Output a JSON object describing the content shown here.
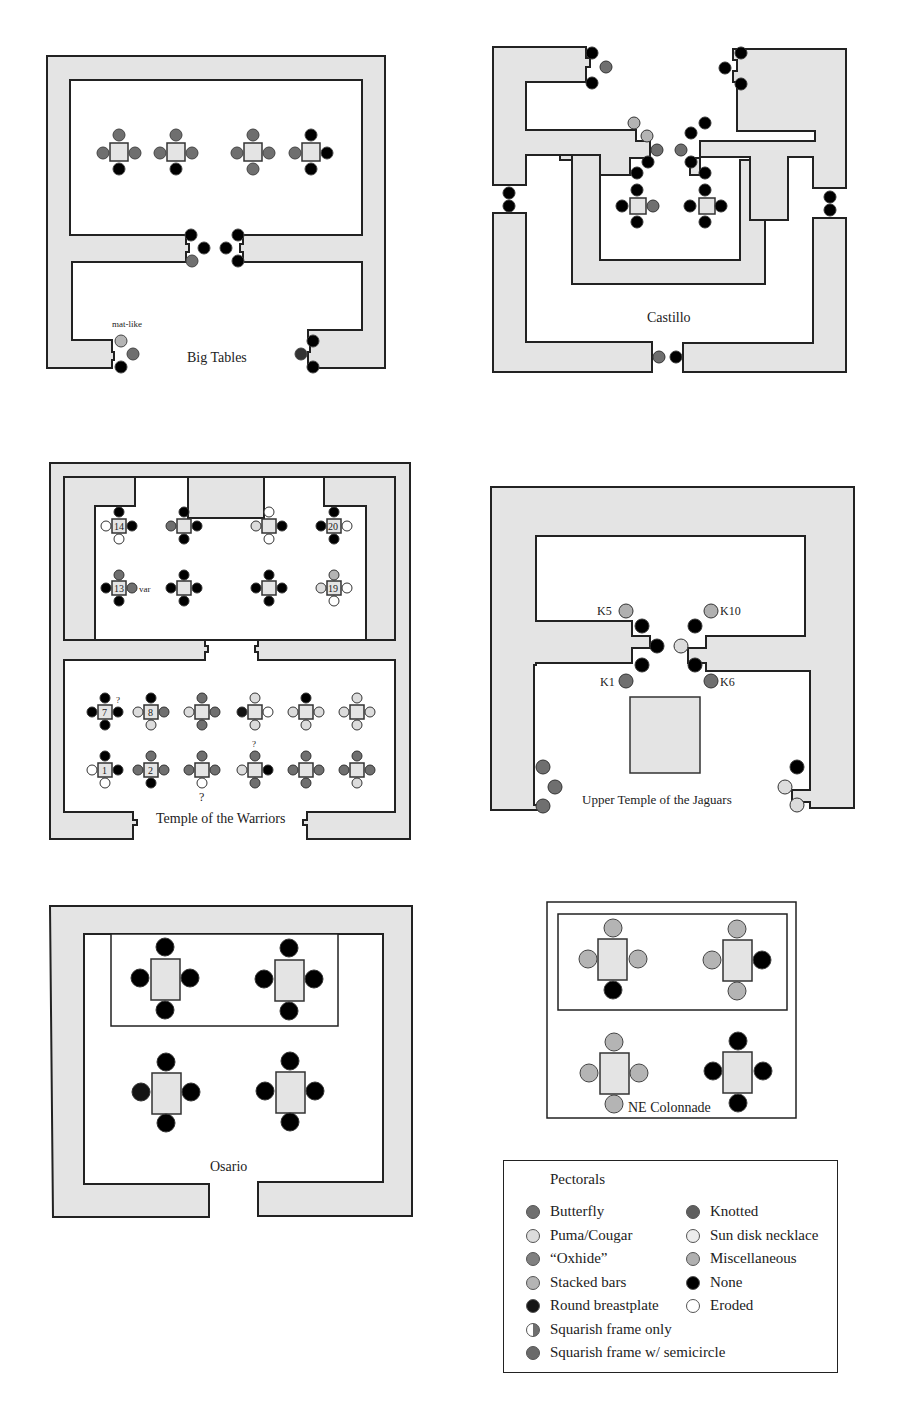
{
  "colors": {
    "wall": "#e4e4e4",
    "butterfly": "#6f6f6f",
    "puma_cougar": "#dcdcdc",
    "oxhide": "#808080",
    "stacked_bars": "#b4b4b4",
    "round_breastplate": "#141414",
    "knotted": "#5f5f5f",
    "sun_disk_necklace": "#ececec",
    "miscellaneous": "#b0b0b0",
    "none": "#000000",
    "eroded": "#ffffff"
  },
  "panels": {
    "big_tables": {
      "title": "Big Tables",
      "annotation": "mat-like"
    },
    "castillo": {
      "title": "Castillo"
    },
    "temple_warriors": {
      "title": "Temple of the Warriors",
      "numbers": [
        "14",
        "20",
        "13",
        "19",
        "7",
        "8",
        "1",
        "2"
      ],
      "var_label": "var",
      "question": "?"
    },
    "upper_jaguars": {
      "title": "Upper Temple of the Jaguars",
      "labels": [
        "K5",
        "K10",
        "K1",
        "K6"
      ]
    },
    "osario": {
      "title": "Osario"
    },
    "ne_colonnade": {
      "title": "NE Colonnade"
    }
  },
  "legend": {
    "title": "Pectorals",
    "items_left": [
      {
        "label": "Butterfly",
        "color": "#6f6f6f",
        "icon": "butterfly-swatch-icon"
      },
      {
        "label": "Puma/Cougar",
        "color": "#dcdcdc",
        "icon": "puma-swatch-icon"
      },
      {
        "label": "“Oxhide”",
        "color": "#808080",
        "icon": "oxhide-swatch-icon"
      },
      {
        "label": "Stacked bars",
        "color": "#b4b4b4",
        "icon": "stacked-bars-swatch-icon"
      },
      {
        "label": "Round breastplate",
        "color": "#141414",
        "icon": "round-breastplate-swatch-icon"
      },
      {
        "label": "Squarish frame only",
        "color": "half",
        "icon": "squarish-frame-swatch-icon"
      },
      {
        "label": "Squarish frame w/ semicircle",
        "color": "#6a6a6a",
        "icon": "squarish-semicircle-swatch-icon"
      }
    ],
    "items_right": [
      {
        "label": "Knotted",
        "color": "#5f5f5f",
        "icon": "knotted-swatch-icon"
      },
      {
        "label": "Sun disk necklace",
        "color": "#ececec",
        "icon": "sun-disk-swatch-icon"
      },
      {
        "label": "Miscellaneous",
        "color": "#b0b0b0",
        "icon": "misc-swatch-icon"
      },
      {
        "label": "None",
        "color": "#000000",
        "icon": "none-swatch-icon"
      },
      {
        "label": "Eroded",
        "color": "#ffffff",
        "icon": "eroded-swatch-icon"
      }
    ]
  }
}
